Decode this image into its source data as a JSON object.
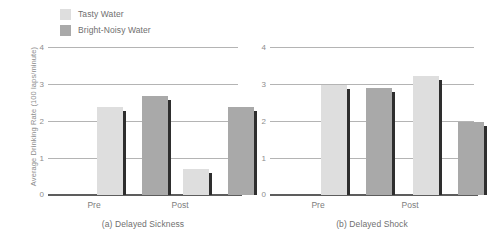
{
  "legend": {
    "items": [
      {
        "label": "Tasty Water",
        "color": "#dedede",
        "icon": "legend-swatch-icon"
      },
      {
        "label": "Bright-Noisy Water",
        "color": "#a9a9a9",
        "icon": "legend-swatch-icon"
      }
    ]
  },
  "axis": {
    "ylabel": "Average Drinking Rate (100 laps/minute)",
    "yticks": [
      "0",
      "1",
      "2",
      "3",
      "4"
    ]
  },
  "colors": {
    "tasty": "#dedede",
    "bright_noisy": "#a9a9a9",
    "shadow": "#2e2e2e",
    "gridline": "#b4b4b4",
    "baseline": "#5d5d5d",
    "text": "#8a8a8a",
    "background": "#ffffff"
  },
  "chart_data": [
    {
      "type": "bar",
      "title": "(a) Delayed Sickness",
      "xlabel": "",
      "ylabel": "Average Drinking Rate (100 laps/minute)",
      "categories": [
        "Pre",
        "Post"
      ],
      "ylim": [
        0,
        4
      ],
      "yticks": [
        0,
        1,
        2,
        3,
        4
      ],
      "grid": true,
      "legend_position": "top-left",
      "series": [
        {
          "name": "Tasty Water",
          "color": "#dedede",
          "values": [
            2.4,
            0.7
          ]
        },
        {
          "name": "Bright-Noisy Water",
          "color": "#a9a9a9",
          "values": [
            2.7,
            2.4
          ]
        }
      ]
    },
    {
      "type": "bar",
      "title": "(b) Delayed Shock",
      "xlabel": "",
      "ylabel": "Average Drinking Rate (100 laps/minute)",
      "categories": [
        "Pre",
        "Post"
      ],
      "ylim": [
        0,
        4
      ],
      "yticks": [
        0,
        1,
        2,
        3,
        4
      ],
      "grid": true,
      "legend_position": "top-left",
      "series": [
        {
          "name": "Tasty Water",
          "color": "#dedede",
          "values": [
            3.0,
            3.25
          ]
        },
        {
          "name": "Bright-Noisy Water",
          "color": "#a9a9a9",
          "values": [
            2.9,
            2.0
          ]
        }
      ]
    }
  ]
}
